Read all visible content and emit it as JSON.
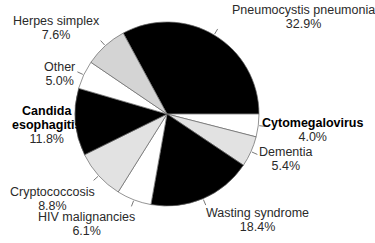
{
  "chart_data": {
    "type": "pie",
    "title": "",
    "start_angle_deg": -118.44,
    "direction": "clockwise",
    "slices": [
      {
        "label": "Pneumocystis pneumonia",
        "value": 32.9,
        "display": "32.9%",
        "fill": "#000000"
      },
      {
        "label": "Cytomegalovirus",
        "value": 4.0,
        "display": "4.0%",
        "fill": "#ffffff"
      },
      {
        "label": "Dementia",
        "value": 5.4,
        "display": "5.4%",
        "fill": "#e2e2e2"
      },
      {
        "label": "Wasting syndrome",
        "value": 18.4,
        "display": "18.4%",
        "fill": "#000000"
      },
      {
        "label": "HIV malignancies",
        "value": 6.1,
        "display": "6.1%",
        "fill": "#ffffff"
      },
      {
        "label": "Cryptococcosis",
        "value": 8.8,
        "display": "8.8%",
        "fill": "#e2e2e2"
      },
      {
        "label": "Candida esophagitis",
        "value": 11.8,
        "display": "11.8%",
        "fill": "#000000"
      },
      {
        "label": "Other",
        "value": 5.0,
        "display": "5.0%",
        "fill": "#ffffff"
      },
      {
        "label": "Herpes simplex",
        "value": 7.6,
        "display": "7.6%",
        "fill": "#d4d4d4"
      }
    ],
    "legend": "none (callout labels)"
  },
  "labels": {
    "pneumocystis": {
      "name": "Pneumocystis pneumonia",
      "pct": "32.9%"
    },
    "cytomegalovirus": {
      "name": "Cytomegalovirus",
      "pct": "4.0%"
    },
    "dementia": {
      "name": "Dementia",
      "pct": "5.4%"
    },
    "wasting": {
      "name": "Wasting syndrome",
      "pct": "18.4%"
    },
    "hiv": {
      "name": "HIV malignancies",
      "pct": "6.1%"
    },
    "crypto": {
      "name": "Cryptococcosis",
      "pct": "8.8%"
    },
    "candida": {
      "name1": "Candida",
      "name2": "esophagitis",
      "pct": "11.8%"
    },
    "other": {
      "name": "Other",
      "pct": "5.0%"
    },
    "herpes": {
      "name": "Herpes simplex",
      "pct": "7.6%"
    }
  }
}
